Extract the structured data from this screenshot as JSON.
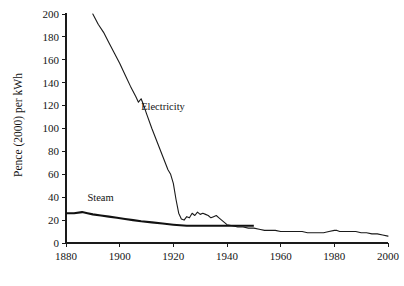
{
  "chart_data": {
    "type": "line",
    "title": "",
    "xlabel": "",
    "ylabel": "Pence (2000) per kWh",
    "xlim": [
      1880,
      2000
    ],
    "ylim": [
      0,
      200
    ],
    "xticks": [
      1880,
      1900,
      1920,
      1940,
      1960,
      1980,
      2000
    ],
    "yticks": [
      0,
      20,
      40,
      60,
      80,
      100,
      120,
      140,
      160,
      180,
      200
    ],
    "xtick_labels": [
      "1880",
      "1900",
      "1920",
      "1940",
      "1960",
      "1980",
      "2000"
    ],
    "ytick_labels": [
      "0",
      "20",
      "40",
      "60",
      "80",
      "100",
      "120",
      "140",
      "160",
      "180",
      "200"
    ],
    "grid": false,
    "legend_position": "inline-annotation",
    "series": [
      {
        "name": "Electricity",
        "label_text": "Electricity",
        "line_style": "thin",
        "color": "#1a1a1a",
        "x": [
          1890,
          1892,
          1894,
          1896,
          1898,
          1900,
          1902,
          1904,
          1906,
          1907,
          1908,
          1909,
          1910,
          1912,
          1914,
          1916,
          1918,
          1919,
          1920,
          1921,
          1922,
          1923,
          1924,
          1925,
          1926,
          1927,
          1928,
          1929,
          1930,
          1931,
          1932,
          1933,
          1934,
          1935,
          1936,
          1937,
          1938,
          1939,
          1940,
          1942,
          1944,
          1946,
          1948,
          1950,
          1952,
          1954,
          1956,
          1958,
          1960,
          1962,
          1964,
          1966,
          1968,
          1970,
          1972,
          1974,
          1976,
          1978,
          1980,
          1981,
          1982,
          1984,
          1986,
          1988,
          1990,
          1992,
          1994,
          1996,
          1998,
          2000
        ],
        "y": [
          200,
          191,
          184,
          175,
          166,
          157,
          147,
          137,
          128,
          123,
          126,
          120,
          113,
          100,
          88,
          76,
          64,
          60,
          52,
          38,
          26,
          21,
          20,
          23,
          22,
          26,
          24,
          27,
          25,
          26,
          25,
          24,
          22,
          23,
          24,
          22,
          20,
          18,
          16,
          15,
          14,
          14,
          13,
          13,
          12,
          11,
          11,
          11,
          10,
          10,
          10,
          10,
          10,
          9,
          9,
          9,
          9,
          10,
          11,
          11,
          10,
          10,
          10,
          10,
          9,
          9,
          8,
          8,
          7,
          6
        ]
      },
      {
        "name": "Steam",
        "label_text": "Steam",
        "line_style": "thick",
        "color": "#111111",
        "x": [
          1880,
          1883,
          1886,
          1888,
          1890,
          1893,
          1896,
          1899,
          1902,
          1905,
          1908,
          1912,
          1916,
          1920,
          1925,
          1930,
          1935,
          1940,
          1945,
          1950
        ],
        "y": [
          26,
          26,
          27,
          26,
          25,
          24,
          23,
          22,
          21,
          20,
          19,
          18,
          17,
          16,
          15,
          15,
          15,
          15,
          15,
          15
        ]
      }
    ],
    "annotations": [
      {
        "text": "Electricity",
        "x": 1908,
        "y": 116
      },
      {
        "text": "Steam",
        "x": 1888,
        "y": 37
      }
    ]
  }
}
